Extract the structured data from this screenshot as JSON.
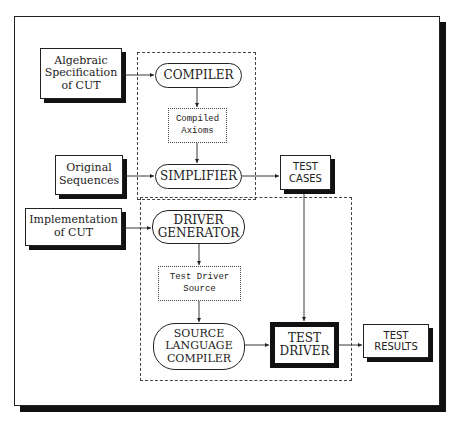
{
  "diagram": {
    "inputs": {
      "algebraic_spec": "Algebraic\nSpecification\nof CUT",
      "original_sequences": "Original\nSequences",
      "implementation": "Implementation\nof CUT"
    },
    "processes": {
      "compiler": "COMPILER",
      "simplifier": "SIMPLIFIER",
      "driver_generator": "DRIVER\nGENERATOR",
      "source_language_compiler": "SOURCE\nLANGUAGE\nCOMPILER"
    },
    "intermediates": {
      "compiled_axioms": "Compiled\nAxioms",
      "test_driver_source": "Test Driver\nSource"
    },
    "outputs": {
      "test_cases": "TEST\nCASES",
      "test_driver": "TEST\nDRIVER",
      "test_results": "TEST\nRESULTS"
    },
    "edges": [
      {
        "from": "Algebraic Specification of CUT",
        "to": "COMPILER"
      },
      {
        "from": "COMPILER",
        "to": "Compiled Axioms"
      },
      {
        "from": "Compiled Axioms",
        "to": "SIMPLIFIER"
      },
      {
        "from": "Original Sequences",
        "to": "SIMPLIFIER"
      },
      {
        "from": "SIMPLIFIER",
        "to": "TEST CASES"
      },
      {
        "from": "TEST CASES",
        "to": "TEST DRIVER"
      },
      {
        "from": "Implementation of CUT",
        "to": "DRIVER GENERATOR"
      },
      {
        "from": "DRIVER GENERATOR",
        "to": "Test Driver Source"
      },
      {
        "from": "Test Driver Source",
        "to": "SOURCE LANGUAGE COMPILER"
      },
      {
        "from": "SOURCE LANGUAGE COMPILER",
        "to": "TEST DRIVER"
      },
      {
        "from": "TEST DRIVER",
        "to": "TEST RESULTS"
      }
    ]
  }
}
